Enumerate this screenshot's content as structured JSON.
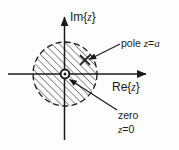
{
  "figure": {
    "kind": "complex-plane-pole-zero-diagram",
    "background_color": "#fdfdfd",
    "ink_color": "#1a1a1a"
  },
  "axes": {
    "imaginary": {
      "label_prefix": "Im{",
      "label_var": "z",
      "label_suffix": "}",
      "label_full": "Im{z}"
    },
    "real": {
      "label_prefix": "Re{",
      "label_var": "z",
      "label_suffix": "}",
      "label_full": "Re{z}"
    }
  },
  "region": {
    "name": "region-of-convergence",
    "shape": "circle",
    "border_style": "dashed",
    "fill_style": "diagonal-hatch",
    "hatch_angle_deg": 45,
    "center": {
      "x": 65,
      "y": 74
    },
    "radius": 32
  },
  "markers": {
    "pole": {
      "glyph": "x",
      "x": 85,
      "y": 60,
      "callout_line1": "pole ",
      "callout_var": "z",
      "callout_eq": "=",
      "callout_val": "a",
      "callout_full": "pole z=a"
    },
    "zero": {
      "glyph": "o",
      "x": 65,
      "y": 74,
      "callout_line1": "zero",
      "callout_line2_var": "z",
      "callout_line2_rest": "=0",
      "callout_full": "zero z=0"
    }
  }
}
